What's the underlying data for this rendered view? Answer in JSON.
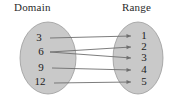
{
  "figure": {
    "width": 180,
    "height": 107,
    "background_color": "#ffffff"
  },
  "headings": {
    "domain": "Domain",
    "range": "Range"
  },
  "colors": {
    "ellipse_fill": "#c9c9c9",
    "ellipse_stroke": "#9a9a9a",
    "arrow_stroke": "#6e6e6e",
    "text": "#1d1d1d",
    "heading_text": "#2b2b2b"
  },
  "chart_data": {
    "type": "diagram",
    "title": "",
    "sets": [
      {
        "name": "Domain",
        "cx": 48,
        "cy": 58,
        "rx": 28,
        "ry": 36,
        "elements": [
          {
            "label": "3",
            "x": 39,
            "y": 38
          },
          {
            "label": "6",
            "x": 41,
            "y": 52
          },
          {
            "label": "9",
            "x": 41,
            "y": 68
          },
          {
            "label": "12",
            "x": 40,
            "y": 82
          }
        ]
      },
      {
        "name": "Range",
        "cx": 138,
        "cy": 58,
        "rx": 25,
        "ry": 36,
        "elements": [
          {
            "label": "1",
            "x": 144,
            "y": 36
          },
          {
            "label": "2",
            "x": 144,
            "y": 47
          },
          {
            "label": "3",
            "x": 144,
            "y": 58
          },
          {
            "label": "4",
            "x": 144,
            "y": 70
          },
          {
            "label": "5",
            "x": 144,
            "y": 82
          }
        ]
      }
    ],
    "mappings": [
      {
        "from": "3",
        "to": "1",
        "x1": 50,
        "y1": 38,
        "x2": 131,
        "y2": 36
      },
      {
        "from": "6",
        "to": "2",
        "x1": 50,
        "y1": 52,
        "x2": 131,
        "y2": 47
      },
      {
        "from": "6",
        "to": "3",
        "x1": 50,
        "y1": 52,
        "x2": 131,
        "y2": 58
      },
      {
        "from": "9",
        "to": "4",
        "x1": 52,
        "y1": 68,
        "x2": 131,
        "y2": 70
      },
      {
        "from": "12",
        "to": "5",
        "x1": 54,
        "y1": 83,
        "x2": 131,
        "y2": 82
      }
    ],
    "arrow_head": {
      "length": 4.5,
      "half_width": 2.0
    }
  }
}
